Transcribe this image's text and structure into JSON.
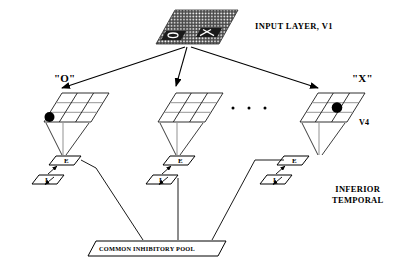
{
  "diagram": {
    "title_input_layer": "INPUT LAYER, V1",
    "label_v4": "V4",
    "label_inferior": "INFERIOR",
    "label_temporal": "TEMPORAL",
    "label_pool": "COMMON INHIBITORY POOL",
    "ellipsis": "·   ·   ·",
    "columns": [
      {
        "id": "column-o",
        "label": "\"O\"",
        "grid_rows": 3,
        "grid_cols": 3,
        "active_cell": {
          "row": 2,
          "col": 0
        },
        "excitatory_label": "E",
        "inhibitory_label": "I"
      },
      {
        "id": "column-middle",
        "label": "",
        "grid_rows": 3,
        "grid_cols": 3,
        "active_cell": null,
        "excitatory_label": "E",
        "inhibitory_label": "I"
      },
      {
        "id": "column-x",
        "label": "\"X\"",
        "grid_rows": 3,
        "grid_cols": 3,
        "active_cell": {
          "row": 1,
          "col": 2
        },
        "excitatory_label": "E",
        "inhibitory_label": "I"
      }
    ],
    "colors": {
      "stroke": "#000000",
      "background": "#ffffff",
      "grid_shade": "#8a8a8a"
    }
  }
}
